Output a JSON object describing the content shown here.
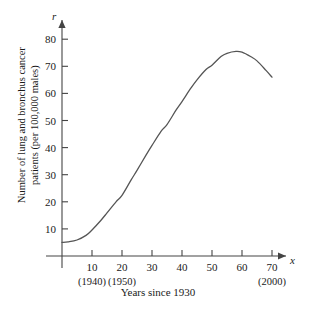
{
  "chart_data": {
    "type": "line",
    "title": "",
    "xlabel": "Years since 1930",
    "ylabel_line1": "Number of lung and bronchus cancer",
    "ylabel_line2": "patients (per 100,000 males)",
    "x_axis_name": "x",
    "y_axis_name": "r",
    "xlim": [
      0,
      73
    ],
    "ylim": [
      0,
      85
    ],
    "grid": false,
    "legend": null,
    "x_ticks": [
      10,
      20,
      30,
      40,
      50,
      60,
      70
    ],
    "x_tick_labels": [
      "10",
      "20",
      "30",
      "40",
      "50",
      "60",
      "70"
    ],
    "x_sub_ticks": [
      {
        "x": 10,
        "label": "(1940)"
      },
      {
        "x": 20,
        "label": "(1950)"
      },
      {
        "x": 70,
        "label": "(2000)"
      }
    ],
    "y_ticks": [
      10,
      20,
      30,
      40,
      50,
      60,
      70,
      80
    ],
    "y_tick_labels": [
      "10",
      "20",
      "30",
      "40",
      "50",
      "60",
      "70",
      "80"
    ],
    "series": [
      {
        "name": "Lung and bronchus cancer rate",
        "color": "#555555",
        "x": [
          0,
          2,
          5,
          8,
          10,
          13,
          15,
          18,
          20,
          23,
          25,
          28,
          30,
          33,
          35,
          38,
          40,
          43,
          45,
          48,
          50,
          53,
          55,
          58,
          60,
          63,
          65,
          68,
          70
        ],
        "values": [
          5.0,
          5.2,
          5.9,
          7.6,
          9.6,
          13.2,
          15.9,
          20.0,
          22.4,
          28.0,
          31.6,
          37.2,
          40.8,
          46.0,
          48.5,
          53.8,
          57.0,
          62.0,
          65.0,
          68.8,
          70.4,
          73.6,
          74.8,
          75.5,
          75.2,
          73.5,
          72.0,
          68.5,
          66.0
        ]
      }
    ]
  },
  "axis_colors": {
    "axis_line": "#444444",
    "curve": "#555555",
    "text": "#1a1a1a",
    "background": "#ffffff"
  }
}
